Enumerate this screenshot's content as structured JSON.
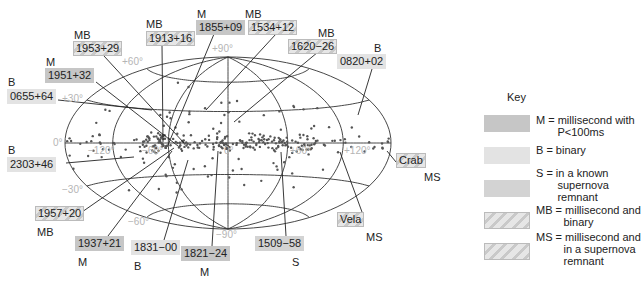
{
  "figure": {
    "grid_labels": {
      "lat_plus90": "+90°",
      "lat_plus60": "+60°",
      "lat_plus30": "+30°",
      "lat_0": "0°",
      "lat_minus30": "−30°",
      "lat_minus60": "−60°",
      "lat_minus90": "−90°",
      "lon_minus120": "−120°",
      "lon_minus60": "−60°",
      "lon_0": "0°",
      "lon_plus60": "+60°",
      "lon_plus120": "+120°"
    },
    "pulsars": [
      {
        "id": "p1953",
        "name": "1953+29",
        "type": "MB",
        "class_label": "MB"
      },
      {
        "id": "p1913",
        "name": "1913+16",
        "type": "MB",
        "class_label": "MB"
      },
      {
        "id": "p1855",
        "name": "1855+09",
        "type": "M",
        "class_label": "M"
      },
      {
        "id": "p1534",
        "name": "1534+12",
        "type": "MB",
        "class_label": "MB"
      },
      {
        "id": "p1620",
        "name": "1620−26",
        "type": "MB",
        "class_label": "MB"
      },
      {
        "id": "p0820",
        "name": "0820+02",
        "type": "B",
        "class_label": "B"
      },
      {
        "id": "p1951",
        "name": "1951+32",
        "type": "M",
        "class_label": "M"
      },
      {
        "id": "p0655",
        "name": "0655+64",
        "type": "B",
        "class_label": "B"
      },
      {
        "id": "p2303",
        "name": "2303+46",
        "type": "B",
        "class_label": "B"
      },
      {
        "id": "pcrab",
        "name": "Crab",
        "type": "MS",
        "class_label": "MS"
      },
      {
        "id": "p1957",
        "name": "1957+20",
        "type": "MB",
        "class_label": "MB"
      },
      {
        "id": "pvela",
        "name": "Vela",
        "type": "MS",
        "class_label": "MS"
      },
      {
        "id": "p1937",
        "name": "1937+21",
        "type": "M",
        "class_label": "M"
      },
      {
        "id": "p1831",
        "name": "1831−00",
        "type": "B",
        "class_label": "B"
      },
      {
        "id": "p1821",
        "name": "1821−24",
        "type": "M",
        "class_label": "M"
      },
      {
        "id": "p1509",
        "name": "1509−58",
        "type": "S",
        "class_label": "S"
      }
    ]
  },
  "key": {
    "title": "Key",
    "items": [
      {
        "code": "M",
        "text": "M = millisecond with\n       P<100ms",
        "color": "#c6c6c6"
      },
      {
        "code": "B",
        "text": "B = binary",
        "color": "#e3e3e3"
      },
      {
        "code": "S",
        "text": "S = in a known\n       supernova\n       remnant",
        "color": "#d3d3d3"
      },
      {
        "code": "MB",
        "text": "MB = millisecond and\n         binary",
        "color": "hatched"
      },
      {
        "code": "MS",
        "text": "MS = millisecond and\n         in a supernova\n         remnant",
        "color": "hatched"
      }
    ]
  },
  "colors": {
    "M": "#c6c6c6",
    "B": "#e3e3e3",
    "S": "#d3d3d3",
    "grid": "#333333",
    "grid_label": "#b5b5b5",
    "dots": "#555555"
  }
}
